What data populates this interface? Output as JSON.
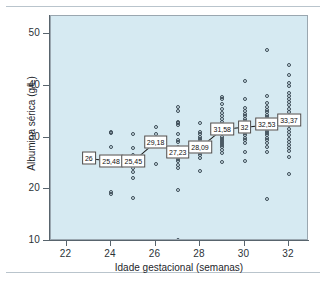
{
  "chart_data": {
    "type": "scatter",
    "title": "",
    "xlabel": "Idade gestacional (semanas)",
    "ylabel": "Albumina sérica (g/L)",
    "xlim": [
      21.3,
      32.9
    ],
    "ylim": [
      10,
      53.5
    ],
    "xticks": [
      22,
      24,
      26,
      28,
      30,
      32
    ],
    "yticks": [
      10,
      20,
      30,
      40,
      50
    ],
    "grid": false,
    "legend": null,
    "background_color": "#d6eaf2",
    "marker_color": "#3b4a55",
    "mean_line_color": "#1a1a1a",
    "mean_label_format": "comma-decimal",
    "categories": [
      23,
      24,
      25,
      26,
      27,
      28,
      29,
      30,
      31,
      32
    ],
    "mean_labels": [
      "26",
      "25,48",
      "25,45",
      "29,18",
      "27,23",
      "28,09",
      "31,58",
      "32",
      "32,53",
      "33,37"
    ],
    "series": [
      {
        "name": "Média de albumina sérica por semana",
        "x": [
          23,
          24,
          25,
          26,
          27,
          28,
          29,
          30,
          31,
          32
        ],
        "values": [
          26,
          25.48,
          25.45,
          29.18,
          27.23,
          28.09,
          31.58,
          32,
          32.53,
          33.37
        ]
      },
      {
        "name": "Observações individuais",
        "points": [
          [
            23,
            26.0
          ],
          [
            24,
            31.0
          ],
          [
            24,
            30.9
          ],
          [
            24,
            28.2
          ],
          [
            24,
            25.6
          ],
          [
            24,
            25.4
          ],
          [
            24,
            19.4
          ],
          [
            24,
            19.1
          ],
          [
            25,
            30.6
          ],
          [
            25,
            28.0
          ],
          [
            25,
            26.6
          ],
          [
            25,
            25.8
          ],
          [
            25,
            25.4
          ],
          [
            25,
            24.9
          ],
          [
            25,
            24.1
          ],
          [
            25,
            23.4
          ],
          [
            25,
            22.1
          ],
          [
            25,
            18.3
          ],
          [
            26,
            32.0
          ],
          [
            26,
            30.6
          ],
          [
            26,
            29.6
          ],
          [
            26,
            29.2
          ],
          [
            26,
            28.8
          ],
          [
            26,
            28.4
          ],
          [
            26,
            24.8
          ],
          [
            27,
            36.0
          ],
          [
            27,
            35.1
          ],
          [
            27,
            33.0
          ],
          [
            27,
            32.8
          ],
          [
            27,
            32.4
          ],
          [
            27,
            30.6
          ],
          [
            27,
            29.6
          ],
          [
            27,
            29.1
          ],
          [
            27,
            28.2
          ],
          [
            27,
            27.8
          ],
          [
            27,
            27.4
          ],
          [
            27,
            27.1
          ],
          [
            27,
            26.6
          ],
          [
            27,
            26.2
          ],
          [
            27,
            25.9
          ],
          [
            27,
            25.4
          ],
          [
            27,
            24.6
          ],
          [
            27,
            24.2
          ],
          [
            27,
            19.9
          ],
          [
            27,
            10.1
          ],
          [
            28,
            32.8
          ],
          [
            28,
            31.1
          ],
          [
            28,
            30.6
          ],
          [
            28,
            30.2
          ],
          [
            28,
            29.8
          ],
          [
            28,
            29.4
          ],
          [
            28,
            29.0
          ],
          [
            28,
            28.6
          ],
          [
            28,
            28.2
          ],
          [
            28,
            27.8
          ],
          [
            28,
            27.4
          ],
          [
            28,
            27.0
          ],
          [
            28,
            26.6
          ],
          [
            28,
            26.1
          ],
          [
            28,
            23.6
          ],
          [
            29,
            37.8
          ],
          [
            29,
            37.4
          ],
          [
            29,
            36.4
          ],
          [
            29,
            35.6
          ],
          [
            29,
            34.8
          ],
          [
            29,
            34.2
          ],
          [
            29,
            33.6
          ],
          [
            29,
            33.1
          ],
          [
            29,
            32.6
          ],
          [
            29,
            32.2
          ],
          [
            29,
            31.8
          ],
          [
            29,
            31.4
          ],
          [
            29,
            31.0
          ],
          [
            29,
            30.6
          ],
          [
            29,
            30.2
          ],
          [
            29,
            29.8
          ],
          [
            29,
            29.4
          ],
          [
            29,
            29.0
          ],
          [
            29,
            28.6
          ],
          [
            29,
            28.2
          ],
          [
            29,
            27.6
          ],
          [
            29,
            27.0
          ],
          [
            29,
            25.2
          ],
          [
            30,
            40.9
          ],
          [
            30,
            37.4
          ],
          [
            30,
            35.8
          ],
          [
            30,
            35.2
          ],
          [
            30,
            34.6
          ],
          [
            30,
            34.1
          ],
          [
            30,
            33.6
          ],
          [
            30,
            33.2
          ],
          [
            30,
            32.8
          ],
          [
            30,
            32.4
          ],
          [
            30,
            32.0
          ],
          [
            30,
            31.6
          ],
          [
            30,
            31.2
          ],
          [
            30,
            30.8
          ],
          [
            30,
            30.4
          ],
          [
            30,
            30.0
          ],
          [
            30,
            29.6
          ],
          [
            30,
            29.0
          ],
          [
            30,
            27.2
          ],
          [
            30,
            25.4
          ],
          [
            31,
            47.0
          ],
          [
            31,
            38.0
          ],
          [
            31,
            36.6
          ],
          [
            31,
            36.0
          ],
          [
            31,
            35.4
          ],
          [
            31,
            34.9
          ],
          [
            31,
            34.4
          ],
          [
            31,
            34.0
          ],
          [
            31,
            33.6
          ],
          [
            31,
            33.2
          ],
          [
            31,
            32.8
          ],
          [
            31,
            32.4
          ],
          [
            31,
            32.0
          ],
          [
            31,
            31.6
          ],
          [
            31,
            31.2
          ],
          [
            31,
            30.8
          ],
          [
            31,
            30.4
          ],
          [
            31,
            30.0
          ],
          [
            31,
            29.6
          ],
          [
            31,
            29.0
          ],
          [
            31,
            28.2
          ],
          [
            31,
            27.2
          ],
          [
            31,
            18.2
          ],
          [
            32,
            44.0
          ],
          [
            32,
            42.0
          ],
          [
            32,
            40.6
          ],
          [
            32,
            40.0
          ],
          [
            32,
            38.6
          ],
          [
            32,
            38.0
          ],
          [
            32,
            37.4
          ],
          [
            32,
            36.8
          ],
          [
            32,
            36.2
          ],
          [
            32,
            35.6
          ],
          [
            32,
            35.0
          ],
          [
            32,
            34.4
          ],
          [
            32,
            33.8
          ],
          [
            32,
            33.2
          ],
          [
            32,
            32.4
          ],
          [
            32,
            31.6
          ],
          [
            32,
            31.0
          ],
          [
            32,
            30.4
          ],
          [
            32,
            29.8
          ],
          [
            32,
            29.2
          ],
          [
            32,
            28.6
          ],
          [
            32,
            28.0
          ],
          [
            32,
            27.4
          ],
          [
            32,
            26.2
          ],
          [
            32,
            23.0
          ]
        ]
      }
    ]
  }
}
